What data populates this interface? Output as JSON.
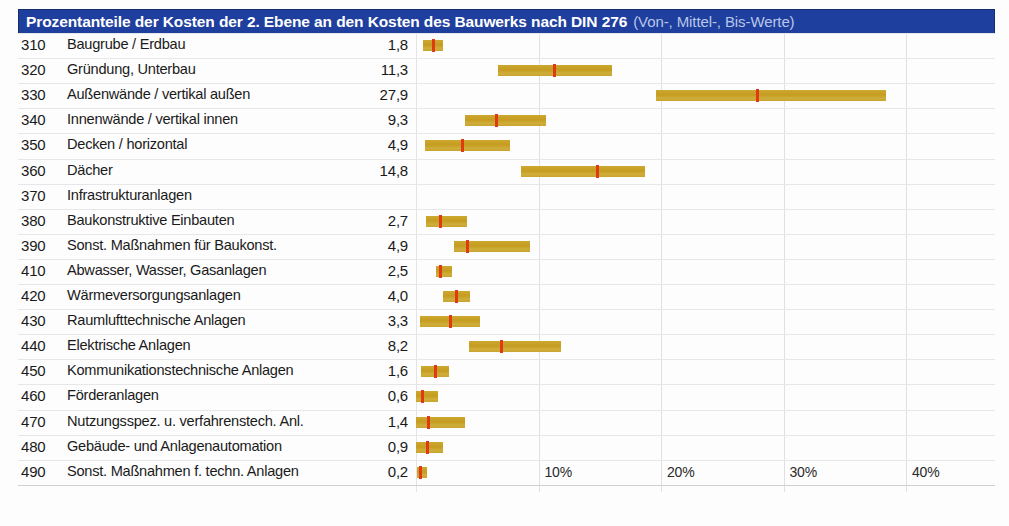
{
  "header": {
    "title_main": "Prozentanteile der Kosten der 2. Ebene an den Kosten des Bauwerks nach DIN 276",
    "title_sub": "(Von-, Mittel-, Bis-Werte)",
    "accent_color": "#1f3f9e",
    "bar_color": "#c8a129",
    "marker_color": "#e03a12"
  },
  "chart_data": {
    "type": "bar",
    "title": "Prozentanteile der Kosten der 2. Ebene an den Kosten des Bauwerks nach DIN 276 (Von-, Mittel-, Bis-Werte)",
    "xlabel": "",
    "ylabel": "",
    "xlim": [
      0,
      44
    ],
    "grid": true,
    "legend": "none",
    "xticks": [
      "10%",
      "20%",
      "30%",
      "40%"
    ],
    "xtick_values": [
      10,
      20,
      30,
      40
    ],
    "value_column_header": "",
    "categories": [
      "310 Baugrube / Erdbau",
      "320 Gründung, Unterbau",
      "330 Außenwände / vertikal außen",
      "340 Innenwände / vertikal innen",
      "350 Decken / horizontal",
      "360 Dächer",
      "370 Infrastrukturanlagen",
      "380 Baukonstruktive Einbauten",
      "390 Sonst. Maßnahmen für Baukonst.",
      "410 Abwasser, Wasser, Gasanlagen",
      "420 Wärmeversorgungsanlagen",
      "430 Raumlufttechnische Anlagen",
      "440 Elektrische Anlagen",
      "450 Kommunikationstechnische Anlagen",
      "460 Förderanlagen",
      "470 Nutzungsspez. u. verfahrenstech. Anl.",
      "480 Gebäude- und Anlagenautomation",
      "490 Sonst. Maßnahmen f. techn. Anlagen"
    ],
    "values": [
      1.8,
      11.3,
      27.9,
      9.3,
      4.9,
      14.8,
      null,
      2.7,
      4.9,
      2.5,
      4.0,
      3.3,
      8.2,
      1.6,
      0.6,
      1.4,
      0.9,
      0.2
    ]
  },
  "rows": [
    {
      "code": "310",
      "label": "Baugrube / Erdbau",
      "value": "1,8",
      "von": 0.6,
      "mittel": 1.4,
      "bis": 2.2
    },
    {
      "code": "320",
      "label": "Gründung, Unterbau",
      "von": 6.7,
      "mittel": 11.3,
      "bis": 16.0,
      "value": "11,3"
    },
    {
      "code": "330",
      "label": "Außenwände / vertikal außen",
      "von": 19.6,
      "mittel": 27.9,
      "bis": 38.4,
      "value": "27,9"
    },
    {
      "code": "340",
      "label": "Innenwände / vertikal innen",
      "von": 4.0,
      "mittel": 6.6,
      "bis": 10.6,
      "value": "9,3"
    },
    {
      "code": "350",
      "label": "Decken / horizontal",
      "von": 0.7,
      "mittel": 3.8,
      "bis": 7.7,
      "value": "4,9"
    },
    {
      "code": "360",
      "label": "Dächer",
      "von": 8.6,
      "mittel": 14.8,
      "bis": 18.7,
      "value": "14,8"
    },
    {
      "code": "370",
      "label": "Infrastrukturanlagen",
      "von": null,
      "mittel": null,
      "bis": null,
      "value": ""
    },
    {
      "code": "380",
      "label": "Baukonstruktive Einbauten",
      "von": 0.8,
      "mittel": 2.0,
      "bis": 4.2,
      "value": "2,7"
    },
    {
      "code": "390",
      "label": "Sonst. Maßnahmen für Baukonst.",
      "von": 3.1,
      "mittel": 4.2,
      "bis": 9.3,
      "value": "4,9"
    },
    {
      "code": "410",
      "label": "Abwasser, Wasser, Gasanlagen",
      "von": 1.6,
      "mittel": 2.0,
      "bis": 2.9,
      "value": "2,5"
    },
    {
      "code": "420",
      "label": "Wärmeversorgungsanlagen",
      "von": 2.2,
      "mittel": 3.3,
      "bis": 4.4,
      "value": "4,0"
    },
    {
      "code": "430",
      "label": "Raumlufttechnische Anlagen",
      "von": 0.3,
      "mittel": 2.8,
      "bis": 5.2,
      "value": "3,3"
    },
    {
      "code": "440",
      "label": "Elektrische Anlagen",
      "von": 4.3,
      "mittel": 7.0,
      "bis": 11.8,
      "value": "8,2"
    },
    {
      "code": "450",
      "label": "Kommunikationstechnische Anlagen",
      "von": 0.4,
      "mittel": 1.6,
      "bis": 2.7,
      "value": "1,6"
    },
    {
      "code": "460",
      "label": "Förderanlagen",
      "von": 0.0,
      "mittel": 0.5,
      "bis": 1.8,
      "value": "0,6"
    },
    {
      "code": "470",
      "label": "Nutzungsspez. u. verfahrenstech. Anl.",
      "von": 0.0,
      "mittel": 1.0,
      "bis": 4.0,
      "value": "1,4"
    },
    {
      "code": "480",
      "label": "Gebäude- und Anlagenautomation",
      "von": 0.0,
      "mittel": 0.9,
      "bis": 2.2,
      "value": "0,9"
    },
    {
      "code": "490",
      "label": "Sonst. Maßnahmen f. techn. Anlagen",
      "von": 0.1,
      "mittel": 0.4,
      "bis": 0.9,
      "value": "0,2"
    }
  ],
  "axis": {
    "ticks": [
      {
        "label": "10%",
        "value": 10
      },
      {
        "label": "20%",
        "value": 20
      },
      {
        "label": "30%",
        "value": 30
      },
      {
        "label": "40%",
        "value": 40
      }
    ]
  }
}
